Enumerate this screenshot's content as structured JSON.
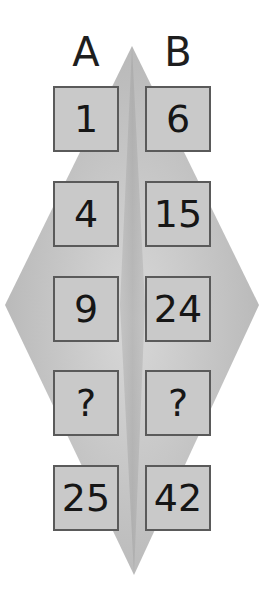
{
  "columns": [
    {
      "label": "A",
      "values": [
        "1",
        "4",
        "9",
        "?",
        "25"
      ]
    },
    {
      "label": "B",
      "values": [
        "6",
        "15",
        "24",
        "?",
        "42"
      ]
    }
  ],
  "colors": {
    "background": "#ffffff",
    "diamond_light": "#d6d6d6",
    "diamond_dark": "#a8a8a8",
    "cell_fill": "#c9c9c9",
    "cell_border": "#5a5a5a",
    "text": "#161616"
  }
}
